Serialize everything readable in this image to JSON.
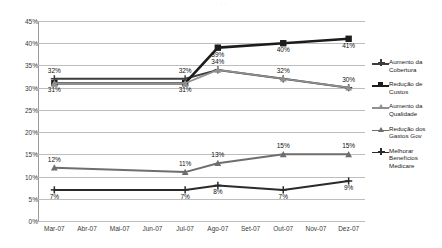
{
  "top_strip": {
    "text": "· · ·"
  },
  "chart_data": {
    "type": "line",
    "title": "",
    "xlabel": "",
    "ylabel": "",
    "ylim": [
      0,
      45
    ],
    "ytick_step": 5,
    "grid": true,
    "legend_position": "right",
    "categories": [
      "Mar-07",
      "Abr-07",
      "Mai-07",
      "Jun-07",
      "Jul-07",
      "Ago-07",
      "Set-07",
      "Out-07",
      "Nov-07",
      "Dez-07"
    ],
    "marker_categories": [
      "Mar-07",
      "Jul-07",
      "Ago-07",
      "Out-07",
      "Dez-07"
    ],
    "ytick_labels": [
      "45%",
      "40%",
      "35%",
      "30%",
      "25%",
      "20%",
      "15%",
      "10%",
      "5%",
      "0%"
    ],
    "ytick_values": [
      45,
      40,
      35,
      30,
      25,
      20,
      15,
      10,
      5,
      0
    ],
    "series": [
      {
        "name": "Aumento da Cobertura",
        "marker": "cross",
        "color": "#3d3d3d",
        "x": [
          "Mar-07",
          "Jul-07",
          "Ago-07",
          "Out-07",
          "Dez-07"
        ],
        "values": [
          32,
          32,
          34,
          32,
          30
        ],
        "labels": [
          "32%",
          "32%",
          "34%",
          "32%",
          "30%"
        ]
      },
      {
        "name": "Redução de Custos",
        "marker": "square",
        "color": "#1c1c1c",
        "x": [
          "Mar-07",
          "Jul-07",
          "Ago-07",
          "Out-07",
          "Dez-07"
        ],
        "values": [
          31,
          31,
          39,
          40,
          41
        ],
        "labels": [
          "31%",
          "31%",
          "39%",
          "40%",
          "41%"
        ]
      },
      {
        "name": "Aumento da Qualidade",
        "marker": "triangle",
        "color": "#8f8f8f",
        "x": [
          "Mar-07",
          "Jul-07",
          "Ago-07",
          "Out-07",
          "Dez-07"
        ],
        "values": [
          31,
          31,
          34,
          32,
          30
        ],
        "labels": [
          "",
          "",
          "",
          "",
          ""
        ]
      },
      {
        "name": "Redução dos Gastos Gov",
        "marker": "triangle",
        "color": "#6e6e6e",
        "x": [
          "Mar-07",
          "Jul-07",
          "Ago-07",
          "Out-07",
          "Dez-07"
        ],
        "values": [
          12,
          11,
          13,
          15,
          15
        ],
        "labels": [
          "12%",
          "11%",
          "13%",
          "15%",
          "15%"
        ]
      },
      {
        "name": "Melhorar Benefícios Medicare",
        "marker": "cross",
        "color": "#2a2a2a",
        "x": [
          "Mar-07",
          "Jul-07",
          "Ago-07",
          "Out-07",
          "Dez-07"
        ],
        "values": [
          7,
          7,
          8,
          7,
          9
        ],
        "labels": [
          "7%",
          "7%",
          "8%",
          "7%",
          "9%"
        ]
      }
    ]
  },
  "legend": {
    "items": [
      {
        "label": "Aumento da Cobertura"
      },
      {
        "label": "Redução de Custos"
      },
      {
        "label": "Aumento da Qualidade"
      },
      {
        "label": "Redução dos Gastos Gov"
      },
      {
        "label": "Melhorar Benefícios Medicare"
      }
    ]
  }
}
